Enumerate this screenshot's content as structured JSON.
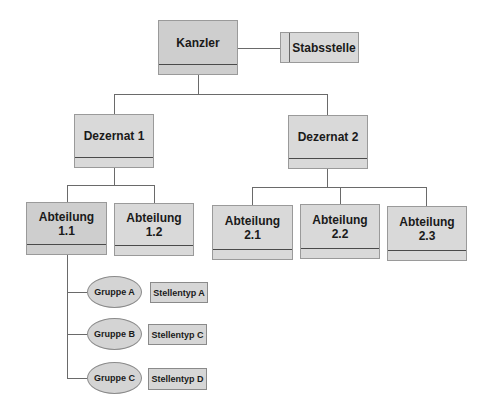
{
  "diagram": {
    "type": "org-chart",
    "colors": {
      "box_fill": "#d9d9d9",
      "box_fill_highlight": "#cecece",
      "line": "#6a6a6a",
      "divider": "#4a4a4a"
    },
    "root": {
      "label": "Kanzler"
    },
    "staff": {
      "label": "Stabsstelle"
    },
    "departments": [
      {
        "label": "Dezernat 1"
      },
      {
        "label": "Dezernat 2"
      }
    ],
    "divisions": [
      {
        "line1": "Abteilung",
        "line2": "1.1",
        "parent": "Dezernat 1"
      },
      {
        "line1": "Abteilung",
        "line2": "1.2",
        "parent": "Dezernat 1"
      },
      {
        "line1": "Abteilung",
        "line2": "2.1",
        "parent": "Dezernat 2"
      },
      {
        "line1": "Abteilung",
        "line2": "2.2",
        "parent": "Dezernat 2"
      },
      {
        "line1": "Abteilung",
        "line2": "2.3",
        "parent": "Dezernat 2"
      }
    ],
    "groups": [
      {
        "label": "Gruppe A",
        "position_type": "Stellentyp A",
        "parent": "Abteilung 1.1"
      },
      {
        "label": "Gruppe B",
        "position_type": "Stellentyp C",
        "parent": "Abteilung 1.1"
      },
      {
        "label": "Gruppe C",
        "position_type": "Stellentyp D",
        "parent": "Abteilung 1.1"
      }
    ]
  }
}
